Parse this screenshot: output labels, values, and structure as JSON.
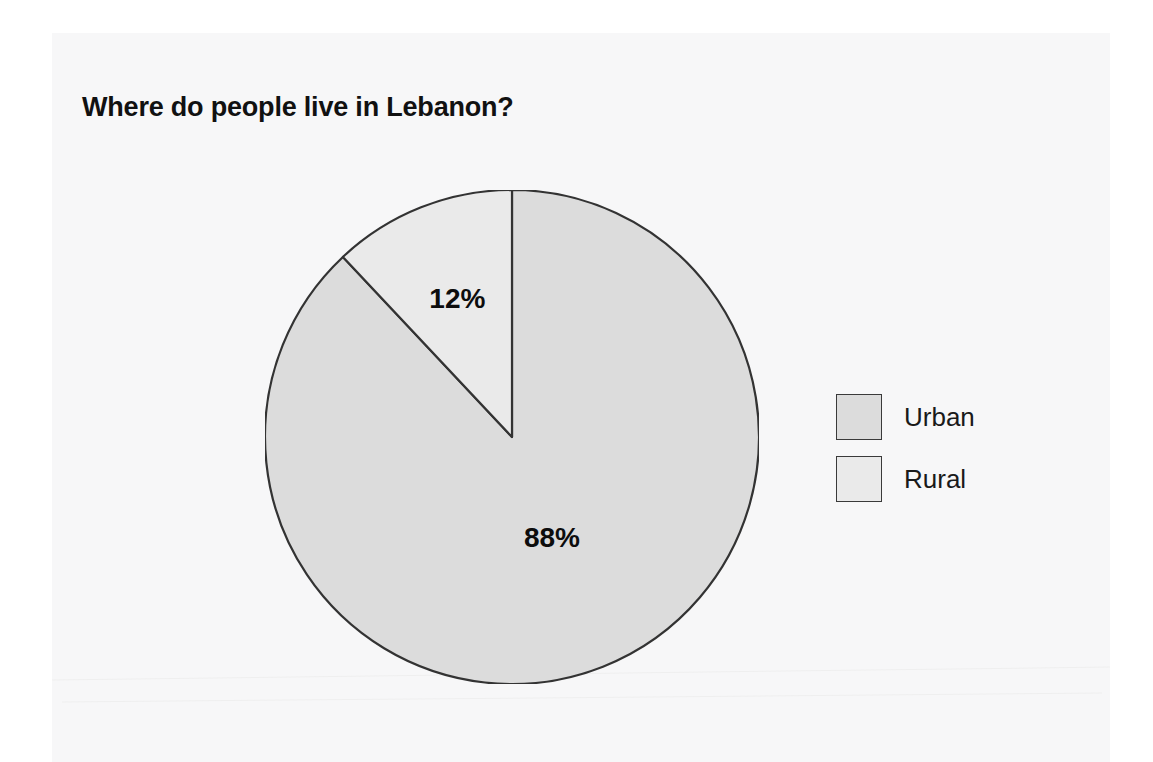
{
  "document": {
    "background_color": "#ffffff",
    "page_color": "#f7f7f8"
  },
  "chart_data": {
    "type": "pie",
    "title": "Where do people live in Lebanon?",
    "categories": [
      "Urban",
      "Rural"
    ],
    "values": [
      88,
      12
    ],
    "unit": "%",
    "data_labels": [
      "88%",
      "12%"
    ],
    "colors": [
      "#dcdcdc",
      "#eaeaea"
    ],
    "slice_border_color": "#333333",
    "start_angle_deg": 0,
    "direction": "clockwise",
    "legend": {
      "position": "right",
      "entries": [
        {
          "label": "Urban",
          "color": "#dcdcdc",
          "value": 88
        },
        {
          "label": "Rural",
          "color": "#eaeaea",
          "value": 12
        }
      ]
    },
    "xlabel": "",
    "ylabel": "",
    "grid": false
  }
}
